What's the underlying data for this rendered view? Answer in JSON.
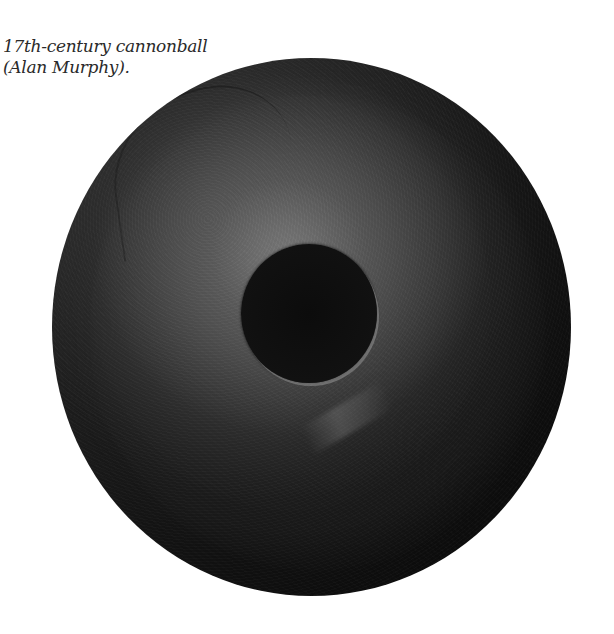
{
  "caption": {
    "line1": "17th-century cannonball",
    "line2": "(Alan Murphy)."
  },
  "figure": {
    "subject": "cannonball",
    "colors": {
      "background": "#ffffff",
      "ball_dark": "#181818",
      "ball_highlight": "#5a5a5a",
      "hole": "#0c0c0c",
      "caption_text": "#2a2a2a"
    }
  }
}
